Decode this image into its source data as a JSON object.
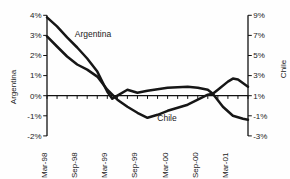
{
  "figure": {
    "width": 290,
    "height": 179,
    "background": "#fefefe",
    "ink_color": "#1a1a1a"
  },
  "chart_data": {
    "type": "line",
    "title": "",
    "dual_y_axes": true,
    "legend": "in-plot text labels",
    "x_axis": {
      "start_month": "Mar-98",
      "x_unit": "months since Mar-98",
      "range_months": [
        0,
        40
      ],
      "tick_labels": [
        "Mar-98",
        "Sep-98",
        "Mar-99",
        "Sep-99",
        "Mar-00",
        "Sep-00",
        "Mar-01"
      ],
      "tick_label_months": [
        0,
        6,
        12,
        18,
        24,
        30,
        36
      ],
      "minor_tick_every_months": 2,
      "labels_rotated_degrees": 90
    },
    "left_axis": {
      "title": "Argentina",
      "tick_labels": [
        "4%",
        "3%",
        "2%",
        "1%",
        "0%",
        "-1%",
        "-2%"
      ],
      "tick_values": [
        4,
        3,
        2,
        1,
        0,
        -1,
        -2
      ],
      "range": [
        -2,
        4
      ],
      "unit": "%"
    },
    "right_axis": {
      "title": "Chile",
      "tick_labels": [
        "9%",
        "7%",
        "5%",
        "3%",
        "1%",
        "-1%",
        "-3%"
      ],
      "tick_values": [
        9,
        7,
        5,
        3,
        1,
        -1,
        -3
      ],
      "range": [
        -3,
        9
      ],
      "unit": "%"
    },
    "series": [
      {
        "name": "Argentina",
        "axis": "left",
        "color": "#161616",
        "line_width": 2.5,
        "points": [
          [
            0,
            3.9
          ],
          [
            2,
            3.45
          ],
          [
            4,
            2.9
          ],
          [
            6,
            2.4
          ],
          [
            8,
            1.85
          ],
          [
            10,
            1.2
          ],
          [
            12,
            0.2
          ],
          [
            13,
            -0.15
          ],
          [
            14,
            0.0
          ],
          [
            16,
            0.3
          ],
          [
            18,
            0.15
          ],
          [
            20,
            0.25
          ],
          [
            24,
            0.4
          ],
          [
            28,
            0.45
          ],
          [
            30,
            0.4
          ],
          [
            32,
            0.3
          ],
          [
            33,
            0.1
          ],
          [
            35,
            -0.55
          ],
          [
            37,
            -1.0
          ],
          [
            39,
            -1.15
          ],
          [
            40,
            -1.2
          ]
        ]
      },
      {
        "name": "Chile",
        "axis": "right",
        "color": "#161616",
        "line_width": 2.5,
        "points": [
          [
            0,
            6.9
          ],
          [
            2,
            5.9
          ],
          [
            4,
            4.9
          ],
          [
            6,
            4.1
          ],
          [
            8,
            3.6
          ],
          [
            10,
            2.9
          ],
          [
            12,
            1.6
          ],
          [
            14,
            0.6
          ],
          [
            16,
            -0.1
          ],
          [
            18,
            -0.7
          ],
          [
            20,
            -1.2
          ],
          [
            22,
            -0.9
          ],
          [
            24,
            -0.5
          ],
          [
            26,
            -0.2
          ],
          [
            28,
            0.1
          ],
          [
            30,
            0.6
          ],
          [
            32,
            1.1
          ],
          [
            33,
            1.2
          ],
          [
            34,
            1.6
          ],
          [
            36,
            2.4
          ],
          [
            37,
            2.7
          ],
          [
            38,
            2.6
          ],
          [
            40,
            1.9
          ]
        ]
      }
    ],
    "annotations": [
      {
        "text": "Argentina",
        "x": 93,
        "y": 34
      },
      {
        "text": "Chile",
        "x": 167,
        "y": 118
      }
    ]
  }
}
